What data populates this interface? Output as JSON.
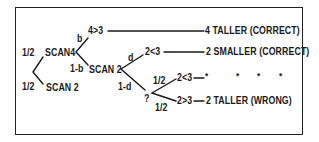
{
  "diagram": {
    "type": "probability-tree",
    "root": {
      "branches": [
        {
          "prob": "1/2",
          "node": "SCAN4",
          "branches": [
            {
              "prob": "b",
              "comparison": "4>3",
              "outcome": "4 TALLER (CORRECT)"
            },
            {
              "prob": "1-b",
              "node": "SCAN 2",
              "branches": [
                {
                  "prob": "d",
                  "comparison": "2<3",
                  "outcome": "2 SMALLER (CORRECT)"
                },
                {
                  "prob": "1-d",
                  "node": "?",
                  "branches": [
                    {
                      "prob": "1/2",
                      "comparison": "2<3",
                      "outcome": "*",
                      "continuation": [
                        "*",
                        "*",
                        "*"
                      ]
                    },
                    {
                      "prob": "1/2",
                      "comparison": "2>3",
                      "outcome": "2 TALLER (WRONG)"
                    }
                  ]
                }
              ]
            }
          ]
        },
        {
          "prob": "1/2",
          "node": "SCAN 2"
        }
      ]
    }
  },
  "labels": {
    "root_upper_prob": "1/2",
    "root_lower_prob": "1/2",
    "scan4": "SCAN4",
    "scan2_lower": "SCAN 2",
    "b": "b",
    "one_minus_b": "1-b",
    "cmp_4_gt_3": "4>3",
    "outcome_4_taller": "4 TALLER (CORRECT)",
    "scan2_mid": "SCAN 2",
    "d": "d",
    "one_minus_d": "1-d",
    "cmp_2_lt_3_a": "2<3",
    "outcome_2_smaller": "2 SMALLER (CORRECT)",
    "question": "?",
    "guess_upper_prob": "1/2",
    "guess_lower_prob": "1/2",
    "cmp_2_lt_3_b": "2<3",
    "star": "*",
    "dot1": "*",
    "dot2": "*",
    "dot3": "*",
    "cmp_2_gt_3": "2>3",
    "outcome_2_taller": "2 TALLER (WRONG)"
  }
}
